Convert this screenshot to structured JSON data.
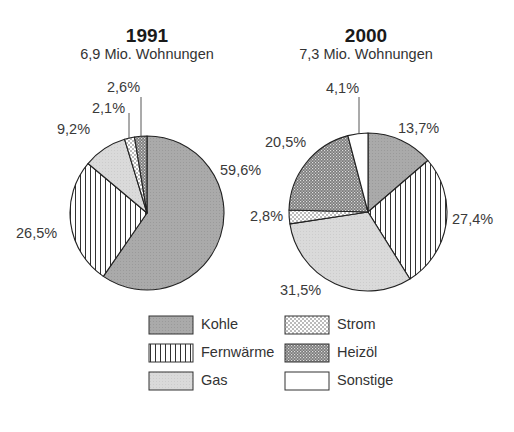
{
  "chart_data": [
    {
      "type": "pie",
      "title": "1991",
      "subtitle": "6,9 Mio. Wohnungen",
      "categories": [
        "Kohle",
        "Fernwärme",
        "Gas",
        "Strom",
        "Heizöl"
      ],
      "values": [
        59.6,
        26.5,
        9.2,
        2.1,
        2.6
      ],
      "labels": [
        "59,6%",
        "26,5%",
        "9,2%",
        "2,1%",
        "2,6%"
      ],
      "start_angle": "12 o'clock, clockwise"
    },
    {
      "type": "pie",
      "title": "2000",
      "subtitle": "7,3 Mio. Wohnungen",
      "categories": [
        "Kohle",
        "Fernwärme",
        "Gas",
        "Strom",
        "Heizöl",
        "Sonstige"
      ],
      "values": [
        13.7,
        27.4,
        31.5,
        2.8,
        20.5,
        4.1
      ],
      "labels": [
        "13,7%",
        "27,4%",
        "31,5%",
        "2,8%",
        "20,5%",
        "4,1%"
      ],
      "start_angle": "12 o'clock, clockwise"
    }
  ],
  "charts": {
    "left": {
      "title": "1991",
      "subtitle": "6,9 Mio. Wohnungen",
      "labels": {
        "kohle": "59,6%",
        "fernwaerme": "26,5%",
        "gas": "9,2%",
        "strom": "2,1%",
        "heizoel": "2,6%"
      }
    },
    "right": {
      "title": "2000",
      "subtitle": "7,3 Mio. Wohnungen",
      "labels": {
        "kohle": "13,7%",
        "fernwaerme": "27,4%",
        "gas": "31,5%",
        "strom": "2,8%",
        "heizoel": "20,5%",
        "sonstige": "4,1%"
      }
    }
  },
  "legend": {
    "items": [
      {
        "key": "kohle",
        "label": "Kohle",
        "pattern": "solid-dark-gray"
      },
      {
        "key": "fernwaerme",
        "label": "Fernwärme",
        "pattern": "vertical-stripes"
      },
      {
        "key": "gas",
        "label": "Gas",
        "pattern": "solid-light-gray"
      },
      {
        "key": "strom",
        "label": "Strom",
        "pattern": "dots"
      },
      {
        "key": "heizoel",
        "label": "Heizöl",
        "pattern": "crosshatch-dark"
      },
      {
        "key": "sonstige",
        "label": "Sonstige",
        "pattern": "white"
      }
    ]
  },
  "colors": {
    "kohle": "#a9a9a9",
    "gas": "#d9d9d9",
    "outline": "#222222",
    "text": "#333333"
  }
}
